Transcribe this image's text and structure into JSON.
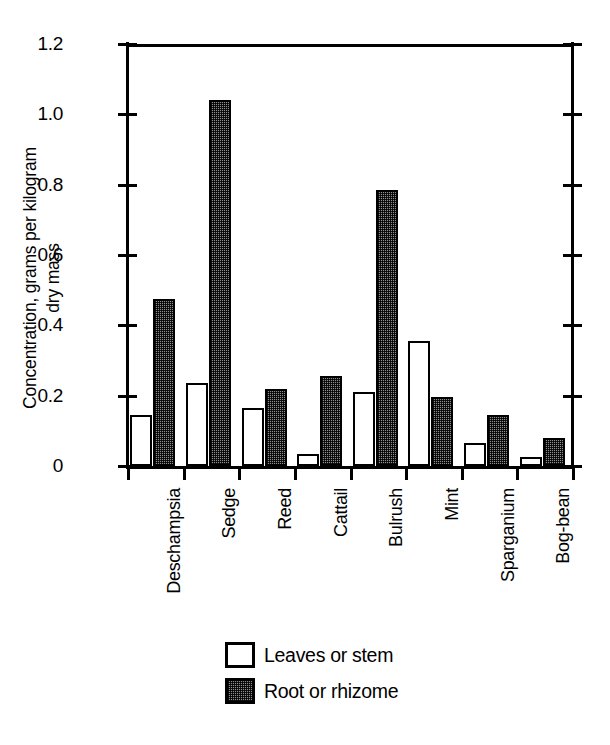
{
  "chart_data": {
    "type": "bar",
    "title": "",
    "xlabel": "",
    "ylabel": "Concentration, grams per kilogram\ndry mass",
    "ylim": [
      0,
      1.2
    ],
    "ytick_labels": [
      "0",
      "0.2",
      "0.4",
      "0.6",
      "0.8",
      "1.0",
      "1.2"
    ],
    "ytick_values": [
      0,
      0.2,
      0.4,
      0.6,
      0.8,
      1.0,
      1.2
    ],
    "grid": false,
    "legend_position": "bottom-center",
    "categories": [
      "Deschampsia",
      "Sedge",
      "Reed",
      "Cattail",
      "Bulrush",
      "Mint",
      "Sparganium",
      "Bog-bean"
    ],
    "series": [
      {
        "name": "Leaves or stem",
        "color": "#ffffff",
        "values": [
          0.145,
          0.235,
          0.165,
          0.035,
          0.21,
          0.355,
          0.065,
          0.025
        ]
      },
      {
        "name": "Root or rhizome",
        "color": "#8d8d8d",
        "values": [
          0.475,
          1.04,
          0.22,
          0.255,
          0.785,
          0.195,
          0.145,
          0.08
        ]
      }
    ]
  },
  "legend": {
    "items": [
      {
        "label": "Leaves or stem",
        "swatch": "leaves"
      },
      {
        "label": "Root or rhizome",
        "swatch": "root"
      }
    ]
  }
}
